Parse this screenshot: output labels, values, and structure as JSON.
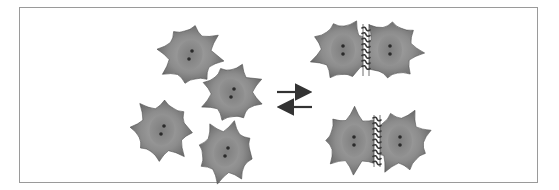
{
  "diagram": {
    "colors": {
      "frame_border": "#9a9a9a",
      "cell_fill_outer": "#6e6e6e",
      "cell_fill_inner": "#9a9a9a",
      "nucleus_fill": "#8a8a8a",
      "nucleolus": "#2a2a2a",
      "junction": "#3a3a3a",
      "arrow": "#333333"
    },
    "single_cells": [
      {
        "id": "cell-1",
        "cx": 190,
        "cy": 55,
        "r": 28,
        "rot": 10
      },
      {
        "id": "cell-2",
        "cx": 232,
        "cy": 93,
        "r": 27,
        "rot": -25
      },
      {
        "id": "cell-3",
        "cx": 162,
        "cy": 130,
        "r": 28,
        "rot": 5
      },
      {
        "id": "cell-4",
        "cx": 226,
        "cy": 152,
        "r": 27,
        "rot": 15
      }
    ],
    "equilibrium_arrows": {
      "forward": {
        "x1": 277,
        "x2": 312,
        "y": 92
      },
      "reverse": {
        "x1": 312,
        "x2": 277,
        "y": 107
      }
    },
    "cell_pairs": [
      {
        "id": "pair-1",
        "left": {
          "cx": 343,
          "cy": 50
        },
        "right": {
          "cx": 390,
          "cy": 50
        },
        "junction_x": 366,
        "y1": 26,
        "y2": 74
      },
      {
        "id": "pair-2",
        "left": {
          "cx": 354,
          "cy": 141
        },
        "right": {
          "cx": 400,
          "cy": 141
        },
        "junction_x": 377,
        "y1": 116,
        "y2": 166
      }
    ]
  }
}
